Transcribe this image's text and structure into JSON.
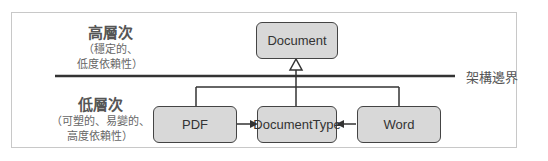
{
  "diagram": {
    "high_level": {
      "title": "高層次",
      "sub1": "（穩定的、",
      "sub2": "低度依賴性）"
    },
    "low_level": {
      "title": "低層次",
      "sub1": "（可塑的、易變的、",
      "sub2": "高度依賴性）"
    },
    "boundary_label": "架構邊界",
    "nodes": {
      "document": "Document",
      "pdf": "PDF",
      "document_type": "DocumentType",
      "word": "Word"
    },
    "colors": {
      "node_fill": "#d8d8d8",
      "line": "#333333",
      "frame": "#c8c8c8"
    }
  }
}
